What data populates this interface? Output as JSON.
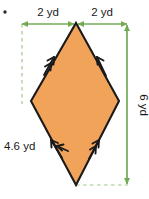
{
  "figure": {
    "kind": "geometry-diagram",
    "shape_name": "rhombus",
    "colors": {
      "fill": "#f2a35a",
      "outline": "#1a1a1a",
      "dimension": "#73ab55",
      "label_text": "#1a1a1a",
      "background": "#ffffff"
    },
    "labels": {
      "top_left": "2 yd",
      "top_right": "2 yd",
      "right": "6 yd",
      "left": "4.6 yd"
    },
    "units": "yd",
    "dimensions": {
      "half_diagonal_horizontal": 2,
      "diagonal_horizontal": 4,
      "diagonal_vertical": 6,
      "side_length": 4.6
    },
    "tick_marks": {
      "upper_left_edge": "double-arrow",
      "upper_right_edge": "single-arrow",
      "lower_left_edge": "single-arrow",
      "lower_right_edge": "double-arrow"
    },
    "bullet_marker": "•"
  }
}
